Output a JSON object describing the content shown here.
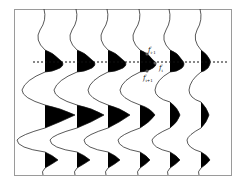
{
  "figure": {
    "trace_count": 6,
    "colors": {
      "trace": "#111111",
      "fill": "#000000",
      "frame": "#9a9a9a",
      "dashed_line": "#111111"
    },
    "labels": {
      "f_prev": "f",
      "f_prev_sub": "i-1",
      "f_curr": "f",
      "f_curr_sub": "i",
      "f_next": "f",
      "f_next_sub": "i+1"
    }
  }
}
